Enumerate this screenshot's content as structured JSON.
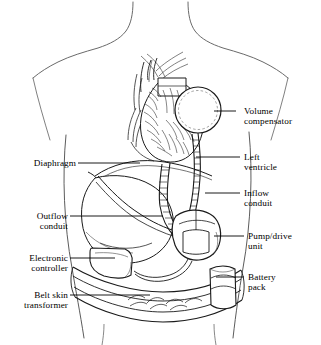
{
  "figure": {
    "domain_note": "anatomical line-art diagram of torso with implanted LVAD components",
    "background_color": "#ffffff",
    "line_color": "#000000",
    "outline_color": "#555555",
    "caption": "diagrammatic illustration of an implantable ventricular assist device"
  },
  "labels": [
    {
      "id": "volume-compensator",
      "text": "Volume\ncompensator",
      "side": "right",
      "text_x": 244,
      "text_y": 106,
      "leader": {
        "x1": 236,
        "y1": 111,
        "x2": 214,
        "y2": 111
      },
      "pointer": {
        "x": 214,
        "y": 111
      }
    },
    {
      "id": "left-ventricle",
      "text": "Left\nventricle",
      "side": "right",
      "text_x": 244,
      "text_y": 152,
      "leader": {
        "x1": 240,
        "y1": 157,
        "x2": 196,
        "y2": 157
      },
      "pointer": {
        "x": 196,
        "y": 157
      }
    },
    {
      "id": "inflow-conduit",
      "text": "Inflow\nconduit",
      "side": "right",
      "text_x": 244,
      "text_y": 188,
      "leader": {
        "x1": 240,
        "y1": 193,
        "x2": 205,
        "y2": 193
      },
      "pointer": {
        "x": 205,
        "y": 193
      }
    },
    {
      "id": "pump-drive-unit",
      "text": "Pump/drive\nunit",
      "side": "right",
      "text_x": 248,
      "text_y": 231,
      "leader": {
        "x1": 244,
        "y1": 236,
        "x2": 214,
        "y2": 236
      },
      "pointer": {
        "x": 214,
        "y": 236
      }
    },
    {
      "id": "battery-pack",
      "text": "Battery\npack",
      "side": "right",
      "text_x": 248,
      "text_y": 272,
      "leader": {
        "x1": 244,
        "y1": 277,
        "x2": 216,
        "y2": 277
      },
      "pointer": {
        "x": 216,
        "y": 277
      }
    },
    {
      "id": "diaphragm",
      "text": "Diaphragm",
      "side": "left",
      "text_x": 20,
      "text_y": 158,
      "leader": {
        "x1": 78,
        "y1": 163,
        "x2": 140,
        "y2": 163
      },
      "pointer": {
        "x": 140,
        "y": 163
      }
    },
    {
      "id": "outflow-conduit",
      "text": "Outflow\nconduit",
      "side": "left",
      "text_x": 20,
      "text_y": 211,
      "leader": {
        "x1": 70,
        "y1": 216,
        "x2": 163,
        "y2": 216
      },
      "pointer": {
        "x": 163,
        "y": 216
      }
    },
    {
      "id": "electronic-controller",
      "text": "Electronic\ncontroller",
      "side": "left",
      "text_x": 8,
      "text_y": 253,
      "leader": {
        "x1": 70,
        "y1": 258,
        "x2": 115,
        "y2": 258
      },
      "pointer": {
        "x": 115,
        "y": 258
      }
    },
    {
      "id": "belt-skin-transformer",
      "text": "Belt skin\ntransformer",
      "side": "left",
      "text_x": 8,
      "text_y": 290,
      "leader": {
        "x1": 70,
        "y1": 295,
        "x2": 150,
        "y2": 295
      },
      "pointer": {
        "x": 150,
        "y": 295
      }
    }
  ],
  "components": [
    {
      "name": "volume-compensator",
      "shape": "circle",
      "cx": 198,
      "cy": 110,
      "r": 23
    },
    {
      "name": "heart",
      "shape": "organ-mass",
      "cx": 168,
      "cy": 130
    },
    {
      "name": "pump-drive-unit",
      "shape": "rounded-box",
      "cx": 196,
      "cy": 232
    },
    {
      "name": "electronic-controller",
      "shape": "rounded-box",
      "cx": 115,
      "cy": 258
    },
    {
      "name": "battery-pack",
      "shape": "rounded-box",
      "cx": 224,
      "cy": 282
    },
    {
      "name": "belt",
      "shape": "band"
    },
    {
      "name": "liver",
      "shape": "organ-mass",
      "cx": 122,
      "cy": 210
    },
    {
      "name": "inflow-conduit",
      "shape": "tube"
    },
    {
      "name": "outflow-conduit",
      "shape": "tube"
    },
    {
      "name": "diaphragm",
      "shape": "curve"
    },
    {
      "name": "torso-outline",
      "shape": "body-contour"
    }
  ]
}
